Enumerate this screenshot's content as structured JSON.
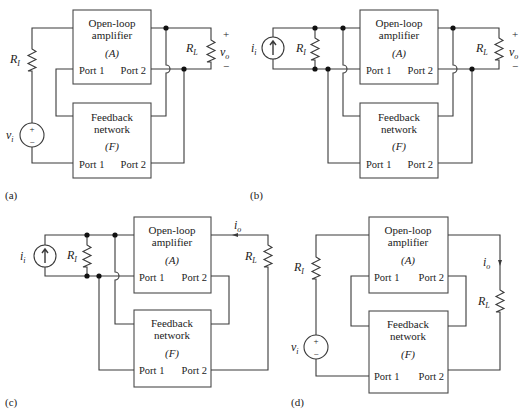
{
  "figure": {
    "panels": [
      {
        "id": "a",
        "label": "(a)",
        "amplifier": {
          "line1": "Open-loop",
          "line2": "amplifier",
          "symbol": "(A)",
          "port1": "Port 1",
          "port2": "Port 2"
        },
        "feedback": {
          "line1": "Feedback",
          "line2": "network",
          "symbol": "(F)",
          "port1": "Port 1",
          "port2": "Port 2"
        },
        "source": {
          "type": "voltage",
          "label": "v",
          "sub": "i",
          "plus": "+",
          "minus": "−"
        },
        "input_resistor": {
          "label": "R",
          "sub": "I"
        },
        "load_resistor": {
          "label": "R",
          "sub": "L"
        },
        "output": {
          "label": "v",
          "sub": "o",
          "plus": "+",
          "minus": "−"
        },
        "input_connection": "series",
        "output_connection": "shunt"
      },
      {
        "id": "b",
        "label": "(b)",
        "amplifier": {
          "line1": "Open-loop",
          "line2": "amplifier",
          "symbol": "(A)",
          "port1": "Port 1",
          "port2": "Port 2"
        },
        "feedback": {
          "line1": "Feedback",
          "line2": "network",
          "symbol": "(F)",
          "port1": "Port 1",
          "port2": "Port 2"
        },
        "source": {
          "type": "current",
          "label": "i",
          "sub": "i"
        },
        "input_resistor": {
          "label": "R",
          "sub": "I"
        },
        "load_resistor": {
          "label": "R",
          "sub": "L"
        },
        "output": {
          "label": "v",
          "sub": "o",
          "plus": "+",
          "minus": "−"
        },
        "input_connection": "shunt",
        "output_connection": "shunt"
      },
      {
        "id": "c",
        "label": "(c)",
        "amplifier": {
          "line1": "Open-loop",
          "line2": "amplifier",
          "symbol": "(A)",
          "port1": "Port 1",
          "port2": "Port 2"
        },
        "feedback": {
          "line1": "Feedback",
          "line2": "network",
          "symbol": "(F)",
          "port1": "Port 1",
          "port2": "Port 2"
        },
        "source": {
          "type": "current",
          "label": "i",
          "sub": "i"
        },
        "input_resistor": {
          "label": "R",
          "sub": "I"
        },
        "load_resistor": {
          "label": "R",
          "sub": "L"
        },
        "output": {
          "label": "i",
          "sub": "o"
        },
        "input_connection": "shunt",
        "output_connection": "series"
      },
      {
        "id": "d",
        "label": "(d)",
        "amplifier": {
          "line1": "Open-loop",
          "line2": "amplifier",
          "symbol": "(A)",
          "port1": "Port 1",
          "port2": "Port 2"
        },
        "feedback": {
          "line1": "Feedback",
          "line2": "network",
          "symbol": "(F)",
          "port1": "Port 1",
          "port2": "Port 2"
        },
        "source": {
          "type": "voltage",
          "label": "v",
          "sub": "i",
          "plus": "+",
          "minus": "−"
        },
        "input_resistor": {
          "label": "R",
          "sub": "I"
        },
        "load_resistor": {
          "label": "R",
          "sub": "L"
        },
        "output": {
          "label": "i",
          "sub": "o"
        },
        "input_connection": "series",
        "output_connection": "series"
      }
    ]
  }
}
